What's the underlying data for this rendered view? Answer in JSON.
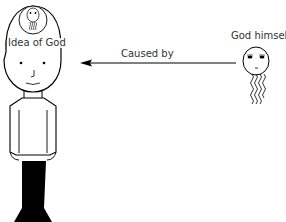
{
  "diagram": {
    "labels": {
      "idea": "Idea of God",
      "caused_by": "Caused by",
      "god": "God himself"
    },
    "colors": {
      "stroke": "#000000",
      "text": "#333333",
      "background": "#ffffff"
    },
    "elements": {
      "person": "human figure with thought bubble",
      "thought": "small god face inside head",
      "arrow": "arrow pointing left from God to person",
      "god": "god face with wavy beard"
    }
  }
}
